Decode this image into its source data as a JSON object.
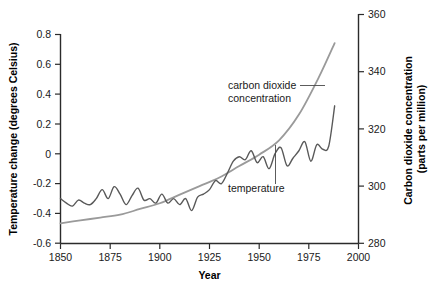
{
  "chart_data": {
    "type": "line",
    "title": "",
    "xlabel": "Year",
    "ylabel": "Temperature change (degrees Celsius)",
    "y2label": "Carbon dioxide concentration (parts per million)",
    "xlim": [
      1850,
      2000
    ],
    "ylim": [
      -0.6,
      0.8
    ],
    "y2lim": [
      280,
      360
    ],
    "grid": false,
    "legend": "inline annotations",
    "xticks": [
      "1850",
      "1875",
      "1900",
      "1925",
      "1950",
      "1975",
      "2000"
    ],
    "xtick_values": [
      1850,
      1875,
      1900,
      1925,
      1950,
      1975,
      2000
    ],
    "yticks": [
      "0.8",
      "0.6",
      "0.4",
      "0.2",
      "0",
      "-0.2",
      "-0.4",
      "-0.6"
    ],
    "ytick_values": [
      0.8,
      0.6,
      0.4,
      0.2,
      0,
      -0.2,
      -0.4,
      -0.6
    ],
    "y2ticks": [
      "360",
      "340",
      "320",
      "300",
      "280"
    ],
    "y2tick_values": [
      360,
      340,
      320,
      300,
      280
    ],
    "annotations": [
      {
        "text_line1": "carbon dioxide",
        "text_line2": "concentration",
        "points_to_series": "carbon dioxide concentration"
      },
      {
        "text_line1": "temperature",
        "text_line2": "",
        "points_to_series": "temperature"
      }
    ],
    "series": [
      {
        "name": "temperature",
        "axis": "left",
        "units": "degrees Celsius",
        "color": "#595959",
        "x": [
          1850,
          1853,
          1856,
          1859,
          1862,
          1865,
          1868,
          1871,
          1874,
          1877,
          1880,
          1883,
          1886,
          1889,
          1892,
          1895,
          1898,
          1901,
          1904,
          1907,
          1910,
          1913,
          1916,
          1919,
          1922,
          1925,
          1928,
          1931,
          1934,
          1937,
          1940,
          1943,
          1946,
          1949,
          1952,
          1955,
          1958,
          1961,
          1964,
          1967,
          1970,
          1973,
          1976,
          1979,
          1982,
          1985,
          1988
        ],
        "values": [
          -0.3,
          -0.33,
          -0.35,
          -0.31,
          -0.33,
          -0.34,
          -0.3,
          -0.24,
          -0.3,
          -0.22,
          -0.27,
          -0.34,
          -0.28,
          -0.23,
          -0.31,
          -0.3,
          -0.33,
          -0.27,
          -0.33,
          -0.3,
          -0.34,
          -0.3,
          -0.38,
          -0.29,
          -0.27,
          -0.24,
          -0.18,
          -0.2,
          -0.13,
          -0.05,
          -0.02,
          -0.04,
          0.02,
          -0.06,
          -0.02,
          -0.1,
          0.0,
          0.04,
          -0.08,
          -0.03,
          0.02,
          0.08,
          -0.05,
          0.06,
          0.03,
          0.05,
          0.32
        ]
      },
      {
        "name": "carbon dioxide concentration",
        "axis": "right",
        "units": "parts per million",
        "color": "#9a9a9a",
        "x": [
          1850,
          1860,
          1870,
          1880,
          1890,
          1900,
          1910,
          1920,
          1930,
          1940,
          1950,
          1960,
          1970,
          1980,
          1988
        ],
        "values": [
          287,
          288,
          289,
          290,
          292,
          294,
          297,
          300,
          303,
          307,
          311,
          316,
          325,
          338,
          350
        ]
      }
    ]
  }
}
